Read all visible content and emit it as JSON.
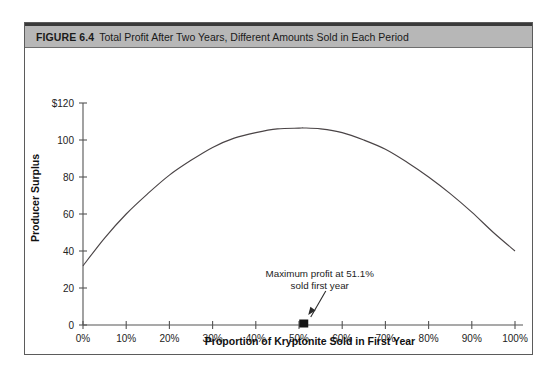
{
  "figure": {
    "number_label": "FIGURE 6.4",
    "title": "Total Profit After Two Years, Different Amounts Sold in Each Period"
  },
  "chart_data": {
    "type": "line",
    "title": "Total Profit After Two Years, Different Amounts Sold in Each Period",
    "xlabel": "Proportion of Kryptonite Sold in First Year",
    "ylabel": "Producer Surplus",
    "xlim": [
      0,
      100
    ],
    "ylim": [
      0,
      120
    ],
    "grid": false,
    "legend": null,
    "x_tick_labels": [
      "0%",
      "10%",
      "20%",
      "30%",
      "40%",
      "50%",
      "60%",
      "70%",
      "80%",
      "90%",
      "100%"
    ],
    "x_tick_values": [
      0,
      10,
      20,
      30,
      40,
      50,
      60,
      70,
      80,
      90,
      100
    ],
    "y_tick_labels": [
      "0",
      "20",
      "40",
      "60",
      "80",
      "100",
      "$120"
    ],
    "y_tick_values": [
      0,
      20,
      40,
      60,
      80,
      100,
      120
    ],
    "series": [
      {
        "name": "Producer Surplus",
        "x": [
          0,
          5,
          10,
          15,
          20,
          25,
          30,
          35,
          40,
          45,
          50,
          51.1,
          55,
          60,
          65,
          70,
          75,
          80,
          85,
          90,
          95,
          100
        ],
        "values": [
          32,
          47,
          60,
          71,
          81,
          89,
          96,
          101,
          104,
          106,
          106.4,
          106.5,
          106,
          104,
          100,
          95,
          88,
          80,
          71,
          61,
          50,
          40
        ]
      }
    ],
    "annotations": [
      {
        "name": "maximum-profit-annotation",
        "line1": "Maximum profit at 51.1%",
        "line2": "sold first year",
        "marker_x": 51.1,
        "marker_y": 0,
        "marker_shape": "square"
      }
    ]
  }
}
